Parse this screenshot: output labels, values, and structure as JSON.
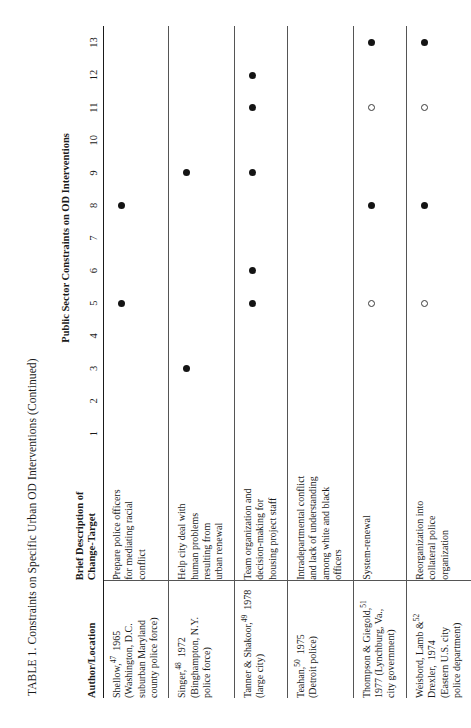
{
  "title": "TABLE 1.  Constraints on Specific Urban OD Interventions (Continued)",
  "group_header": "Public Sector Constraints on OD Interventions",
  "columns": {
    "author_header": "Author/Location",
    "desc_header_line1": "Brief Description of",
    "desc_header_line2": "Change-Target",
    "numbers": [
      "1",
      "2",
      "3",
      "4",
      "5",
      "6",
      "7",
      "8",
      "9",
      "10",
      "11",
      "12",
      "13"
    ]
  },
  "markers": {
    "filled": "●",
    "open": "○"
  },
  "rows": [
    {
      "author": "Shellow,",
      "ref": "47",
      "year": "1965",
      "location_lines": [
        "(Washington, D.C.",
        "suburban Maryland",
        "county police force)"
      ],
      "description_lines": [
        "Prepare police officers",
        "for mediating racial",
        "conflict"
      ],
      "marks": [
        "",
        "",
        "",
        "",
        "filled",
        "",
        "",
        "filled",
        "",
        "",
        "",
        "",
        ""
      ]
    },
    {
      "author": "Singer,",
      "ref": "48",
      "year": "1972",
      "location_lines": [
        "(Binghampton, N.Y.",
        "police force)"
      ],
      "description_lines": [
        "Help city deal with",
        "human problems",
        "resulting from",
        "urban renewal"
      ],
      "marks": [
        "",
        "",
        "filled",
        "",
        "",
        "",
        "",
        "",
        "filled",
        "",
        "",
        "",
        ""
      ]
    },
    {
      "author": "Tanner & Shakoor,",
      "ref": "49",
      "year": "1978 (large city)",
      "location_lines": [],
      "description_lines": [
        "Team organization and",
        "decision-making for",
        "housing project staff"
      ],
      "marks": [
        "",
        "",
        "",
        "",
        "filled",
        "filled",
        "",
        "",
        "filled",
        "",
        "filled",
        "filled",
        ""
      ]
    },
    {
      "author": "Teahan,",
      "ref": "50",
      "year": "1975",
      "location_lines": [
        "(Detroit police)"
      ],
      "description_lines": [
        "Intradepartmental conflict",
        "and lack of understanding",
        "among white and black",
        "officers"
      ],
      "marks": [
        "",
        "",
        "",
        "",
        "",
        "",
        "",
        "",
        "",
        "",
        "",
        "",
        ""
      ]
    },
    {
      "author": "Thompson & Giegold,",
      "ref": "51",
      "year": "",
      "location_lines": [
        "1977 (Lynchburg, Va.,",
        "city government)"
      ],
      "description_lines": [
        "System-renewal"
      ],
      "marks": [
        "",
        "",
        "",
        "",
        "open",
        "",
        "",
        "filled",
        "",
        "",
        "open",
        "",
        "filled"
      ]
    },
    {
      "author": "Weisbord, Lamb &",
      "ref": "52",
      "year": "",
      "location_lines": [
        "Drexler,  1974",
        "(Eastern U.S. city",
        "police department)"
      ],
      "description_lines": [
        "Reorganization into",
        "collateral police",
        "organization"
      ],
      "marks": [
        "",
        "",
        "",
        "",
        "open",
        "",
        "",
        "filled",
        "",
        "",
        "open",
        "",
        "filled"
      ]
    }
  ]
}
